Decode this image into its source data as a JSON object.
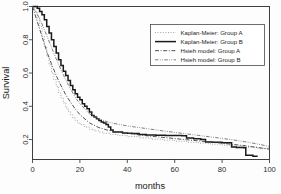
{
  "figure": {
    "background": "#fdfdfd",
    "foreground": "#2b2b2b"
  },
  "axes": {
    "x_title": "months",
    "y_title": "Survival",
    "x_ticks": [
      "0",
      "20",
      "40",
      "60",
      "80",
      "100"
    ],
    "y_ticks": [
      "0.2",
      "0.4",
      "0.6",
      "0.8",
      "1.0"
    ]
  },
  "legend": {
    "position": "top-right",
    "items": [
      {
        "label": "Kaplan-Meier: Group A",
        "style": "dotted",
        "color": "#8d8d8d",
        "width": 0.8
      },
      {
        "label": "Kaplan-Meier: Group B",
        "style": "solid",
        "color": "#1a1a1a",
        "width": 1.5
      },
      {
        "label": "Hsieh model: Group A",
        "style": "dash-dot",
        "color": "#3d3d3d",
        "width": 0.9
      },
      {
        "label": "Hsieh model: Group B",
        "style": "dash-dot-dot",
        "color": "#6f6f6f",
        "width": 0.9
      }
    ]
  },
  "chart_data": {
    "type": "line",
    "title": "",
    "xlabel": "months",
    "ylabel": "Survival",
    "xlim": [
      0,
      100
    ],
    "ylim": [
      0.08,
      1.0
    ],
    "grid": false,
    "legend_position": "top-right",
    "series": [
      {
        "name": "Kaplan-Meier: Group A",
        "style": "dotted",
        "color": "#8d8d8d",
        "step": true,
        "x": [
          0,
          1,
          2,
          3,
          4,
          5,
          6,
          7,
          8,
          9,
          10,
          11,
          12,
          13,
          14,
          15,
          16,
          17,
          18,
          19,
          20,
          22,
          24,
          26,
          28,
          30,
          33,
          36,
          40,
          45,
          50,
          55,
          60,
          65,
          70,
          75,
          80,
          85,
          90,
          95,
          100
        ],
        "y": [
          1.0,
          0.97,
          0.93,
          0.88,
          0.82,
          0.76,
          0.7,
          0.65,
          0.6,
          0.56,
          0.52,
          0.48,
          0.45,
          0.42,
          0.39,
          0.37,
          0.35,
          0.33,
          0.315,
          0.3,
          0.29,
          0.275,
          0.262,
          0.252,
          0.245,
          0.238,
          0.23,
          0.225,
          0.218,
          0.21,
          0.202,
          0.196,
          0.19,
          0.184,
          0.178,
          0.172,
          0.166,
          0.16,
          0.154,
          0.148,
          0.142
        ]
      },
      {
        "name": "Kaplan-Meier: Group B",
        "style": "solid",
        "color": "#1a1a1a",
        "step": true,
        "x": [
          0,
          1,
          2,
          3,
          4,
          5,
          6,
          7,
          8,
          9,
          10,
          11,
          12,
          13,
          14,
          15,
          16,
          17,
          18,
          19,
          20,
          21,
          22,
          23,
          24,
          25,
          26,
          27,
          28,
          29,
          30,
          31,
          32,
          33,
          34,
          36,
          38,
          40,
          42,
          44,
          45,
          48,
          52,
          56,
          60,
          63,
          65,
          68,
          71,
          73,
          76,
          80,
          84,
          86,
          89,
          90,
          93,
          95
        ],
        "y": [
          1.0,
          1.0,
          0.99,
          0.97,
          0.95,
          0.92,
          0.88,
          0.84,
          0.8,
          0.76,
          0.72,
          0.68,
          0.645,
          0.61,
          0.585,
          0.555,
          0.525,
          0.5,
          0.475,
          0.455,
          0.44,
          0.415,
          0.4,
          0.385,
          0.365,
          0.345,
          0.335,
          0.325,
          0.315,
          0.305,
          0.3,
          0.29,
          0.275,
          0.258,
          0.245,
          0.245,
          0.24,
          0.238,
          0.237,
          0.236,
          0.23,
          0.228,
          0.226,
          0.225,
          0.224,
          0.223,
          0.21,
          0.205,
          0.2,
          0.185,
          0.183,
          0.18,
          0.155,
          0.152,
          0.15,
          0.105,
          0.1,
          0.1
        ]
      },
      {
        "name": "Hsieh model: Group A",
        "style": "dash-dot",
        "color": "#3d3d3d",
        "step": false,
        "x": [
          0,
          2,
          4,
          6,
          8,
          10,
          12,
          14,
          16,
          18,
          20,
          24,
          28,
          32,
          36,
          40,
          45,
          50,
          55,
          60,
          65,
          70,
          75,
          80,
          85,
          90,
          95,
          100
        ],
        "y": [
          1.0,
          0.91,
          0.82,
          0.73,
          0.655,
          0.585,
          0.525,
          0.47,
          0.425,
          0.385,
          0.35,
          0.3,
          0.272,
          0.255,
          0.245,
          0.238,
          0.228,
          0.22,
          0.213,
          0.206,
          0.199,
          0.192,
          0.185,
          0.178,
          0.17,
          0.162,
          0.152,
          0.142
        ]
      },
      {
        "name": "Hsieh model: Group B",
        "style": "dash-dot-dot",
        "color": "#6f6f6f",
        "step": false,
        "x": [
          0,
          2,
          4,
          6,
          8,
          10,
          12,
          14,
          16,
          18,
          20,
          24,
          28,
          32,
          36,
          40,
          45,
          50,
          55,
          60,
          65,
          70,
          75,
          80,
          85,
          90,
          95,
          100
        ],
        "y": [
          1.0,
          0.955,
          0.895,
          0.825,
          0.755,
          0.685,
          0.62,
          0.56,
          0.505,
          0.455,
          0.415,
          0.355,
          0.325,
          0.305,
          0.292,
          0.282,
          0.272,
          0.262,
          0.252,
          0.243,
          0.234,
          0.225,
          0.216,
          0.207,
          0.197,
          0.186,
          0.173,
          0.158
        ]
      }
    ]
  }
}
